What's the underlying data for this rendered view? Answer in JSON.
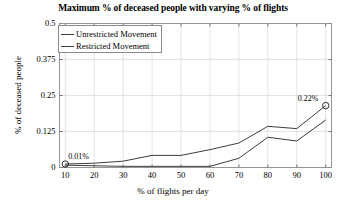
{
  "chart_data": {
    "type": "line",
    "title": "Maximum % of deceased people with varying % of flights",
    "xlabel": "% of flights per day",
    "ylabel": "% of deceased people",
    "xlim": [
      8,
      102
    ],
    "ylim": [
      0,
      0.5
    ],
    "grid": true,
    "legend_position": "top-left",
    "x": [
      10,
      20,
      30,
      40,
      50,
      60,
      70,
      80,
      90,
      100
    ],
    "xticks": [
      "10",
      "20",
      "30",
      "40",
      "50",
      "60",
      "70",
      "80",
      "90",
      "100"
    ],
    "yticks": [
      "0",
      "0.125",
      "0.25",
      "0.375",
      "0.5"
    ],
    "series": [
      {
        "name": "Unrestricted Movement",
        "color": "#3d3d3d",
        "values": [
          0.012,
          0.015,
          0.022,
          0.042,
          0.042,
          0.062,
          0.085,
          0.143,
          0.135,
          0.215
        ]
      },
      {
        "name": "Restricted Movement",
        "color": "#3d3d3d",
        "values": [
          0.008,
          0.006,
          0.004,
          0.004,
          0.004,
          0.004,
          0.032,
          0.105,
          0.092,
          0.165
        ]
      }
    ],
    "annotations": [
      {
        "text": "0.01%",
        "x": 10,
        "y": 0.012,
        "marker": "circle"
      },
      {
        "text": "0.22%",
        "x": 100,
        "y": 0.215,
        "marker": "circle"
      }
    ]
  }
}
